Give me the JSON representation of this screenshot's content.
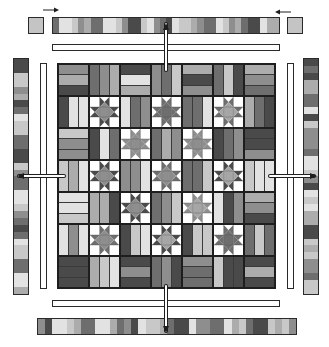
{
  "diagram": {
    "type": "quilt-assembly",
    "colors": {
      "outline": "#1e1e1e",
      "background": "#ffffff",
      "dark": "#4a4a4a",
      "mid_dark": "#6e6e6e",
      "mid": "#8e8e8e",
      "mid_light": "#acacac",
      "light": "#c8c8c8",
      "pale": "#e2e2e2",
      "corner_square": "#c4c4c4",
      "star_center": "#a6a6a6"
    },
    "grid": {
      "rows": 7,
      "cols": 7,
      "legend": {
        "H": "rail block, horizontal stripes",
        "V": "rail block, vertical stripes",
        "S": "sawtooth star block"
      },
      "layout": [
        [
          "H",
          "V",
          "H",
          "V",
          "H",
          "V",
          "H"
        ],
        [
          "V",
          "S",
          "V",
          "S",
          "V",
          "S",
          "V"
        ],
        [
          "H",
          "V",
          "S",
          "V",
          "S",
          "V",
          "H"
        ],
        [
          "V",
          "S",
          "V",
          "S",
          "V",
          "S",
          "V"
        ],
        [
          "H",
          "V",
          "S",
          "V",
          "S",
          "V",
          "H"
        ],
        [
          "V",
          "S",
          "V",
          "S",
          "V",
          "S",
          "V"
        ],
        [
          "H",
          "V",
          "H",
          "V",
          "H",
          "V",
          "H"
        ]
      ]
    },
    "borders": {
      "top": {
        "label": "top pieced border",
        "segments": 36
      },
      "bottom": {
        "label": "bottom pieced border",
        "segments": 36
      },
      "left": {
        "label": "left pieced border",
        "segments": 34
      },
      "right": {
        "label": "right pieced border",
        "segments": 34
      }
    },
    "corners": [
      "top-left corner square",
      "top-right corner square"
    ],
    "sashing": [
      "top sashing strip",
      "bottom sashing strip",
      "left sashing strip",
      "right sashing strip"
    ],
    "arrows": [
      {
        "name": "arrow-top",
        "direction": "up"
      },
      {
        "name": "arrow-bottom",
        "direction": "down"
      },
      {
        "name": "arrow-left",
        "direction": "left"
      },
      {
        "name": "arrow-right",
        "direction": "right"
      },
      {
        "name": "arrow-top-left-corner",
        "direction": "right"
      },
      {
        "name": "arrow-top-right-corner",
        "direction": "left"
      }
    ]
  }
}
